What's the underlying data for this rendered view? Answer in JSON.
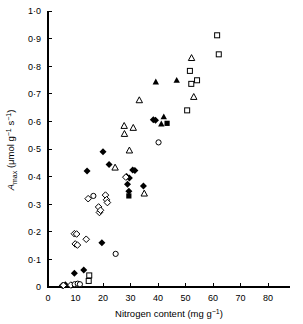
{
  "chart_data": {
    "type": "scatter",
    "title": "",
    "xlabel": "Nitrogen content (mg g−1)",
    "ylabel": "A max (μmol g−1 s−1)",
    "ylabel_parts": {
      "italic": "A",
      "subscript": "max",
      "units": "(μmol g−1 s−1)"
    },
    "xlabel_parts": {
      "text": "Nitrogen content (mg g",
      "exponent": "−1",
      "close": ")"
    },
    "xlim": [
      0,
      88
    ],
    "ylim": [
      0,
      1.0
    ],
    "xticks": [
      0,
      10,
      20,
      30,
      40,
      50,
      60,
      70,
      80
    ],
    "xtick_labels": [
      "0",
      "10",
      "20",
      "30",
      "40",
      "50",
      "60",
      "70",
      "80"
    ],
    "yticks": [
      0,
      0.1,
      0.2,
      0.3,
      0.4,
      0.5,
      0.6,
      0.7,
      0.8,
      0.9,
      1.0
    ],
    "ytick_labels": [
      "0",
      "0·1",
      "0·2",
      "0·3",
      "0·4",
      "0·5",
      "0·6",
      "0·7",
      "0·8",
      "0·9",
      "1·0"
    ],
    "grid": false,
    "legend": false,
    "legend_position": "none",
    "series": [
      {
        "name": "filled-diamond",
        "marker": "filled-diamond",
        "color": "#000000",
        "points": [
          [
            5.2,
            0.005
          ],
          [
            6.3,
            0.008
          ],
          [
            9.6,
            0.05
          ],
          [
            13.0,
            0.062
          ],
          [
            14.2,
            0.42
          ],
          [
            19.6,
            0.16
          ],
          [
            20.0,
            0.49
          ],
          [
            22.2,
            0.444
          ],
          [
            28.6,
            0.4
          ],
          [
            28.9,
            0.372
          ],
          [
            29.4,
            0.347
          ],
          [
            29.6,
            0.395
          ],
          [
            30.8,
            0.424
          ],
          [
            31.6,
            0.422
          ],
          [
            34.7,
            0.366
          ],
          [
            38.3,
            0.606
          ],
          [
            39.1,
            0.604
          ]
        ]
      },
      {
        "name": "open-diamond",
        "marker": "open-diamond",
        "color": "#000000",
        "points": [
          [
            5.6,
            0.006
          ],
          [
            8.3,
            0.007
          ],
          [
            9.6,
            0.193
          ],
          [
            10.4,
            0.192
          ],
          [
            9.9,
            0.156
          ],
          [
            10.7,
            0.152
          ],
          [
            13.9,
            0.173
          ],
          [
            14.6,
            0.32
          ],
          [
            18.4,
            0.29
          ],
          [
            18.7,
            0.27
          ],
          [
            19.1,
            0.278
          ],
          [
            20.9,
            0.333
          ],
          [
            21.3,
            0.316
          ],
          [
            21.6,
            0.306
          ],
          [
            28.3,
            0.398
          ]
        ]
      },
      {
        "name": "open-circle",
        "marker": "open-circle",
        "color": "#000000",
        "points": [
          [
            9.7,
            0.01
          ],
          [
            10.8,
            0.012
          ],
          [
            11.6,
            0.01
          ],
          [
            16.5,
            0.33
          ],
          [
            24.6,
            0.12
          ],
          [
            40.2,
            0.524
          ]
        ]
      },
      {
        "name": "filled-square",
        "marker": "filled-square",
        "color": "#000000",
        "points": [
          [
            29.4,
            0.33
          ],
          [
            43.3,
            0.593
          ]
        ]
      },
      {
        "name": "open-square",
        "marker": "open-square",
        "color": "#000000",
        "points": [
          [
            14.8,
            0.022
          ],
          [
            15.0,
            0.042
          ],
          [
            50.6,
            0.64
          ],
          [
            51.6,
            0.783
          ],
          [
            52.1,
            0.736
          ],
          [
            54.2,
            0.749
          ],
          [
            61.5,
            0.912
          ],
          [
            62.1,
            0.843
          ]
        ]
      },
      {
        "name": "open-triangle",
        "marker": "open-triangle",
        "color": "#000000",
        "points": [
          [
            24.4,
            0.432
          ],
          [
            27.7,
            0.583
          ],
          [
            27.8,
            0.554
          ],
          [
            29.6,
            0.494
          ],
          [
            31.0,
            0.576
          ],
          [
            33.2,
            0.676
          ],
          [
            35.0,
            0.338
          ],
          [
            52.2,
            0.829
          ],
          [
            53.0,
            0.688
          ]
        ]
      },
      {
        "name": "filled-triangle",
        "marker": "filled-triangle",
        "color": "#000000",
        "points": [
          [
            39.2,
            0.742
          ],
          [
            41.2,
            0.59
          ],
          [
            42.1,
            0.616
          ],
          [
            46.8,
            0.748
          ]
        ]
      }
    ]
  },
  "figure": {
    "caption": ""
  }
}
